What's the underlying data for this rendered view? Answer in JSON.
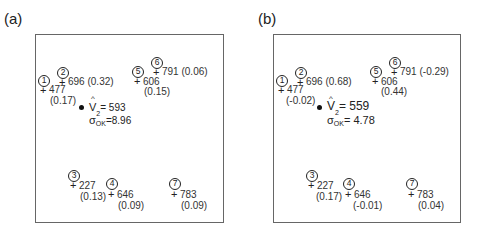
{
  "panels": [
    {
      "label": "(a)",
      "points": [
        {
          "id": "1",
          "value": "477",
          "weight": "(0.17)"
        },
        {
          "id": "2",
          "value": "696",
          "weight": "(0.32)"
        },
        {
          "id": "3",
          "value": "227",
          "weight": "(0.13)"
        },
        {
          "id": "4",
          "value": "646",
          "weight": "(0.09)"
        },
        {
          "id": "5",
          "value": "606",
          "weight": "(0.15)"
        },
        {
          "id": "6",
          "value": "791",
          "weight": "(0.06)"
        },
        {
          "id": "7",
          "value": "783",
          "weight": "(0.09)"
        }
      ],
      "estimate": {
        "symbol": "V",
        "subscript": "2",
        "value": "= 593",
        "variance_symbol": "σ",
        "variance_sub": "OK",
        "variance_sup": "2",
        "variance_value": "=8.96"
      }
    },
    {
      "label": "(b)",
      "points": [
        {
          "id": "1",
          "value": "477",
          "weight": "(-0.02)"
        },
        {
          "id": "2",
          "value": "696",
          "weight": "(0.68)"
        },
        {
          "id": "3",
          "value": "227",
          "weight": "(0.17)"
        },
        {
          "id": "4",
          "value": "646",
          "weight": "(-0.01)"
        },
        {
          "id": "5",
          "value": "606",
          "weight": "(0.44)"
        },
        {
          "id": "6",
          "value": "791",
          "weight": "(-0.29)"
        },
        {
          "id": "7",
          "value": "783",
          "weight": "(0.04)"
        }
      ],
      "estimate": {
        "symbol": "V",
        "subscript": "2",
        "value": "= 559",
        "variance_symbol": "σ",
        "variance_sub": "OK",
        "variance_sup": "2",
        "variance_value": "= 4.78"
      }
    }
  ],
  "symbols": {
    "cross": "+",
    "hat": "^"
  }
}
